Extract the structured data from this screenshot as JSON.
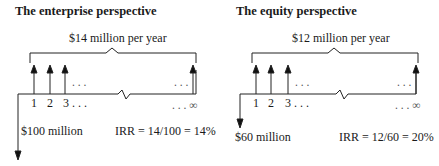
{
  "panels": [
    {
      "title": "The enterprise perspective",
      "annual_flow_label": "$14 million per year",
      "time_labels": [
        "1",
        "2",
        "3 . . ."
      ],
      "dots_upper_left": ". . .",
      "dots_upper_right": ". . .",
      "end_label": ". . . ∞",
      "investment_label": "$100 million",
      "irr_label": "IRR = 14/100 = 14%"
    },
    {
      "title": "The equity perspective",
      "annual_flow_label": "$12 million per year",
      "time_labels": [
        "1",
        "2",
        "3 . . ."
      ],
      "dots_upper_left": ". . .",
      "dots_upper_right": ". . .",
      "end_label": ". . . ∞",
      "investment_label": "$60 million",
      "irr_label": "IRR = 12/60 = 20%"
    }
  ]
}
